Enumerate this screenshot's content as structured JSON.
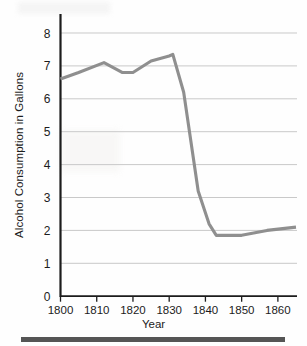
{
  "chart_data": {
    "type": "line",
    "title": "",
    "xlabel": "Year",
    "ylabel": "Alcohol Consumption in Gallons",
    "xlim": [
      1800,
      1865
    ],
    "ylim": [
      0,
      8
    ],
    "grid": "horizontal",
    "legend": "none",
    "line_color": "#8f8f8f",
    "axis_color": "#1c1c1c",
    "gridline_color": "#c9c9c9",
    "background_color": "#fefefe",
    "x_ticks": [
      1800,
      1810,
      1820,
      1830,
      1840,
      1850,
      1860
    ],
    "x_tick_labels": [
      "1800",
      "1810",
      "1820",
      "1830",
      "1840",
      "1850",
      "1860"
    ],
    "y_ticks": [
      0,
      1,
      2,
      3,
      4,
      5,
      6,
      7,
      8
    ],
    "y_tick_labels": [
      "0",
      "1",
      "2",
      "3",
      "4",
      "5",
      "6",
      "7",
      "8"
    ],
    "series": [
      {
        "name": "Alcohol Consumption",
        "x": [
          1800,
          1805,
          1812,
          1817,
          1820,
          1825,
          1830,
          1831,
          1834,
          1838,
          1841,
          1843,
          1850,
          1857,
          1865
        ],
        "values": [
          6.6,
          6.8,
          7.1,
          6.8,
          6.8,
          7.15,
          7.3,
          7.35,
          6.2,
          3.2,
          2.2,
          1.85,
          1.85,
          2.0,
          2.1
        ]
      }
    ]
  },
  "figure": {
    "y_axis_title": "Alcohol Consumption in Gallons",
    "x_axis_title": "Year"
  }
}
